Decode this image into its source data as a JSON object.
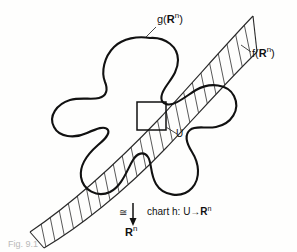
{
  "figure": {
    "background_color": "#fefefd",
    "ink_color": "#111111",
    "labels": {
      "g_image": "g(",
      "g_symbol": "R",
      "g_exponent": "n",
      "g_close": ")",
      "f_image": "f(",
      "f_symbol": "R",
      "f_exponent": "n",
      "f_close": ")",
      "neighborhood": "U",
      "congruent": "≅",
      "chart_text": "chart h: U→",
      "chart_symbol": "R",
      "chart_exponent": "n",
      "target_symbol": "R",
      "target_exponent": "n",
      "caption": "Fig. 9.1"
    }
  },
  "elements": {
    "blob_name": "manifold-blob-outline",
    "band_name": "hatched-band",
    "square_name": "chart-neighborhood-square",
    "arrow_name": "chart-map-arrow"
  }
}
